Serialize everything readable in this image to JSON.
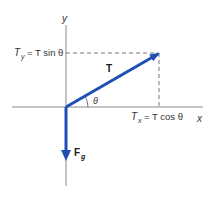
{
  "diagram": {
    "axes": {
      "x_label": "x",
      "y_label": "y"
    },
    "vectors": {
      "tension": {
        "label": "T",
        "color": "#1f4fb5"
      },
      "gravity": {
        "label_main": "F",
        "label_sub": "g",
        "color": "#1f4fb5"
      }
    },
    "angle_label": "θ",
    "components": {
      "y_component": {
        "lhs": "T",
        "lhs_sub": "y",
        "rhs": "= T sin θ"
      },
      "x_component": {
        "lhs": "T",
        "lhs_sub": "x",
        "rhs": "= T cos θ"
      }
    },
    "colors": {
      "axis": "#8a8a8a",
      "dashed": "#7a7a7a",
      "vector": "#1f4fb5"
    }
  }
}
